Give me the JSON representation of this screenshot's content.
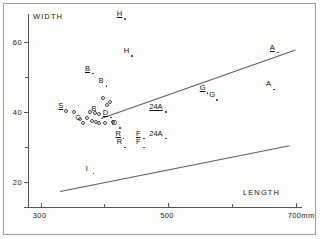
{
  "chart_data": {
    "type": "scatter",
    "title": "",
    "xlabel": "LENGTH",
    "ylabel": "WIDTH",
    "xlim": [
      280,
      710
    ],
    "ylim": [
      13,
      68
    ],
    "x_ticks": [
      300,
      400,
      500,
      600,
      700
    ],
    "x_tick_labels": [
      "300",
      "",
      "500",
      "",
      "700mm"
    ],
    "y_ticks": [
      20,
      30,
      40,
      50,
      60
    ],
    "y_tick_labels": [
      "20",
      "",
      "40",
      "",
      "60"
    ],
    "grid": false,
    "legend": "none",
    "units": "mm",
    "annotations": [
      {
        "label": "H",
        "underlined": true,
        "x": 432,
        "y": 66.5,
        "marker": "dot"
      },
      {
        "label": "H",
        "underlined": false,
        "x": 443,
        "y": 56.0,
        "marker": "dot"
      },
      {
        "label": "B",
        "underlined": true,
        "x": 382,
        "y": 51.0,
        "marker": "dot"
      },
      {
        "label": "B",
        "underlined": false,
        "x": 403,
        "y": 47.5,
        "marker": "dot"
      },
      {
        "label": "A",
        "underlined": true,
        "x": 672,
        "y": 57.0,
        "marker": "dot"
      },
      {
        "label": "A",
        "underlined": false,
        "x": 666,
        "y": 46.5,
        "marker": "dot"
      },
      {
        "label": "G",
        "underlined": true,
        "x": 562,
        "y": 45.5,
        "marker": "dot"
      },
      {
        "label": "G",
        "underlined": false,
        "x": 577,
        "y": 43.5,
        "marker": "dot"
      },
      {
        "label": "S",
        "underlined": true,
        "x": 340,
        "y": 40.5,
        "marker": "circle"
      },
      {
        "label": "24A",
        "underlined": true,
        "x": 497,
        "y": 40.0,
        "marker": "dot"
      },
      {
        "label": "24A",
        "underlined": false,
        "x": 497,
        "y": 32.5,
        "marker": "dot"
      },
      {
        "label": "C",
        "underlined": false,
        "x": 367,
        "y": 37.0,
        "marker": "circle"
      },
      {
        "label": "B",
        "underlined": false,
        "x": 392,
        "y": 39.5,
        "marker": "circle"
      },
      {
        "label": "D",
        "underlined": true,
        "x": 410,
        "y": 38.5,
        "marker": "dot"
      },
      {
        "label": "D",
        "underlined": false,
        "x": 424,
        "y": 35.5,
        "marker": "dot"
      },
      {
        "label": "R",
        "underlined": true,
        "x": 430,
        "y": 32.5,
        "marker": "dot"
      },
      {
        "label": "R",
        "underlined": false,
        "x": 432,
        "y": 30.0,
        "marker": "dot"
      },
      {
        "label": "F",
        "underlined": true,
        "x": 462,
        "y": 32.5,
        "marker": "dot"
      },
      {
        "label": "F",
        "underlined": false,
        "x": 462,
        "y": 30.0,
        "marker": "dot"
      },
      {
        "label": "I",
        "underlined": false,
        "x": 383,
        "y": 22.5,
        "marker": "dot"
      }
    ],
    "cluster_circles": [
      {
        "x": 352,
        "y": 40.0
      },
      {
        "x": 372,
        "y": 38.5
      },
      {
        "x": 377,
        "y": 40.0
      },
      {
        "x": 381,
        "y": 37.5
      },
      {
        "x": 385,
        "y": 39.8
      },
      {
        "x": 387,
        "y": 37.2
      },
      {
        "x": 398,
        "y": 44.0
      },
      {
        "x": 404,
        "y": 42.0
      },
      {
        "x": 409,
        "y": 42.8
      },
      {
        "x": 401,
        "y": 37.0
      },
      {
        "x": 414,
        "y": 37.2
      },
      {
        "x": 362,
        "y": 38.0
      },
      {
        "x": 392,
        "y": 36.8
      }
    ],
    "trend_lines": [
      {
        "name": "upper-bound",
        "x1": 395,
        "y1": 38.5,
        "x2": 700,
        "y2": 58.0
      },
      {
        "name": "lower-bound",
        "x1": 330,
        "y1": 17.5,
        "x2": 690,
        "y2": 30.5
      }
    ]
  },
  "figure": {
    "x_axis_title": "LENGTH",
    "y_axis_title": "WIDTH"
  }
}
